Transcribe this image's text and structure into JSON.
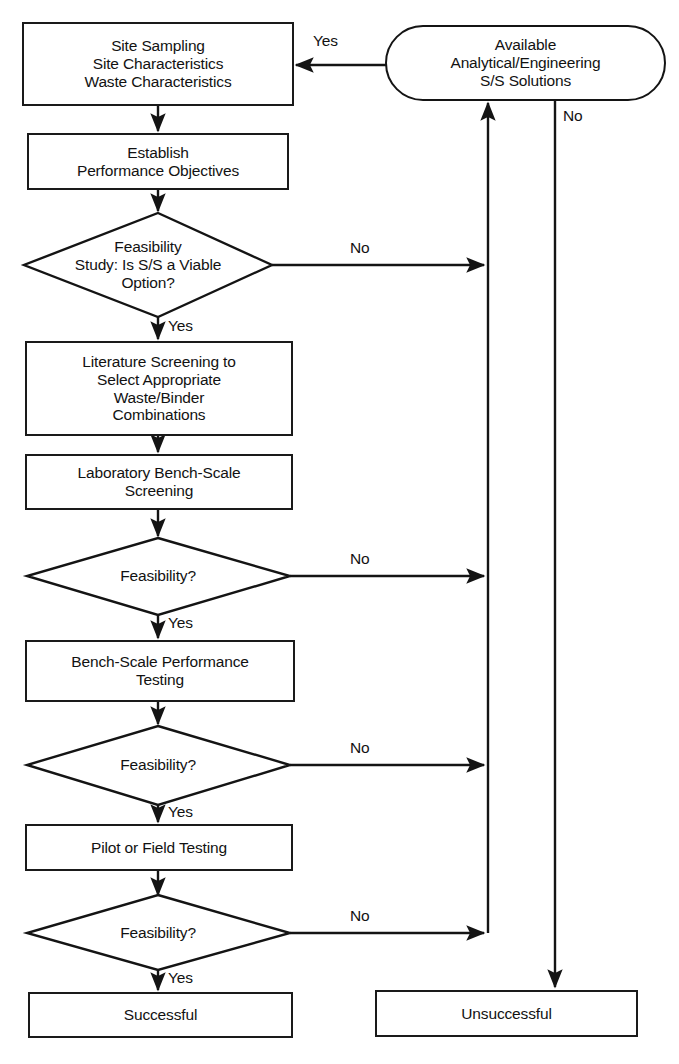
{
  "diagram": {
    "type": "flowchart",
    "nodes": [
      {
        "id": "site-sampling",
        "shape": "process",
        "text": "Site Sampling\nSite Characteristics\nWaste Characteristics"
      },
      {
        "id": "available-solutions",
        "shape": "terminal",
        "text": "Available\nAnalytical/Engineering\nS/S Solutions"
      },
      {
        "id": "establish-objectives",
        "shape": "process",
        "text": "Establish\nPerformance Objectives"
      },
      {
        "id": "feasibility-study",
        "shape": "decision",
        "text": "Feasibility\nStudy: Is S/S a Viable\nOption?"
      },
      {
        "id": "literature-screening",
        "shape": "process",
        "text": "Literature Screening to\nSelect Appropriate\nWaste/Binder\nCombinations"
      },
      {
        "id": "lab-bench-screening",
        "shape": "process",
        "text": "Laboratory Bench-Scale\nScreening"
      },
      {
        "id": "feasibility-2",
        "shape": "decision",
        "text": "Feasibility?"
      },
      {
        "id": "bench-scale-performance",
        "shape": "process",
        "text": "Bench-Scale Performance\nTesting"
      },
      {
        "id": "feasibility-3",
        "shape": "decision",
        "text": "Feasibility?"
      },
      {
        "id": "pilot-field-testing",
        "shape": "process",
        "text": "Pilot or Field Testing"
      },
      {
        "id": "feasibility-4",
        "shape": "decision",
        "text": "Feasibility?"
      },
      {
        "id": "successful",
        "shape": "process",
        "text": "Successful"
      },
      {
        "id": "unsuccessful",
        "shape": "process",
        "text": "Unsuccessful"
      }
    ],
    "edge_labels": {
      "solutions_to_site_yes": "Yes",
      "solutions_no": "No",
      "feasibility_study_no": "No",
      "feasibility_study_yes": "Yes",
      "feasibility_2_no": "No",
      "feasibility_2_yes": "Yes",
      "feasibility_3_no": "No",
      "feasibility_3_yes": "Yes",
      "feasibility_4_no": "No",
      "feasibility_4_yes": "Yes"
    },
    "colors": {
      "stroke": "#141414",
      "fill": "#ffffff",
      "text": "#121212"
    }
  }
}
